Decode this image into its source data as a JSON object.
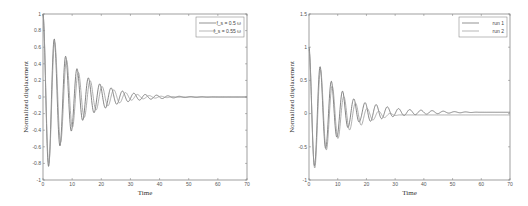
{
  "chart_data": [
    {
      "type": "line",
      "title": "",
      "xlabel": "Time",
      "ylabel": "Normalized displacement",
      "xlim": [
        0,
        70
      ],
      "ylim": [
        -1,
        1
      ],
      "xticks": [
        "0",
        "10",
        "20",
        "30",
        "40",
        "50",
        "60",
        "70"
      ],
      "yticks": [
        "-1",
        "-0.8",
        "-0.6",
        "-0.4",
        "-0.2",
        "0",
        "0.2",
        "0.4",
        "0.6",
        "0.8",
        "1"
      ],
      "grid": false,
      "legend_position": "upper right",
      "series": [
        {
          "name": "f_s = 0.5 ω",
          "x": [
            0,
            2,
            4,
            6,
            8,
            10,
            12,
            14,
            16,
            18,
            20,
            25,
            30,
            35,
            40,
            45,
            50,
            60,
            70
          ],
          "values": [
            1,
            -0.83,
            0.69,
            -0.58,
            0.48,
            -0.4,
            0.33,
            -0.27,
            0.22,
            -0.18,
            0.15,
            0.09,
            0.05,
            0.03,
            0.02,
            0.01,
            0.005,
            0,
            0
          ]
        },
        {
          "name": "f_s = 0.55 ω",
          "x": [
            0,
            2,
            4,
            6,
            8,
            10,
            12,
            14,
            16,
            18,
            20,
            25,
            30,
            35,
            40,
            45,
            50,
            60,
            70
          ],
          "values": [
            1,
            -0.8,
            0.66,
            -0.55,
            0.45,
            -0.37,
            0.3,
            -0.25,
            0.2,
            -0.16,
            0.13,
            0.08,
            0.04,
            0.02,
            0.01,
            0.005,
            0,
            0,
            0
          ]
        }
      ]
    },
    {
      "type": "line",
      "title": "",
      "xlabel": "Time",
      "ylabel": "Normalized displacement",
      "xlim": [
        0,
        70
      ],
      "ylim": [
        -1,
        1.5
      ],
      "xticks": [
        "0",
        "10",
        "20",
        "30",
        "40",
        "50",
        "60",
        "70"
      ],
      "yticks": [
        "-1",
        "-0.5",
        "0",
        "0.5",
        "1",
        "1.5"
      ],
      "grid": false,
      "legend_position": "upper right",
      "series": [
        {
          "name": "run 1",
          "x": [
            0,
            2,
            4,
            6,
            8,
            10,
            12,
            14,
            16,
            18,
            20,
            25,
            30,
            35,
            40,
            45,
            50,
            60,
            70
          ],
          "values": [
            1,
            -0.82,
            0.7,
            -0.55,
            0.48,
            -0.38,
            0.33,
            -0.23,
            0.22,
            -0.15,
            0.17,
            0.12,
            0.08,
            0.06,
            0.05,
            0.04,
            0.03,
            0.02,
            0.02
          ]
        },
        {
          "name": "run 2",
          "x": [
            0,
            2,
            4,
            6,
            8,
            10,
            12,
            14,
            16,
            18,
            20,
            25,
            30,
            35,
            40,
            45,
            50,
            60,
            70
          ],
          "values": [
            1,
            -0.82,
            0.7,
            -0.55,
            0.46,
            -0.38,
            0.3,
            -0.25,
            0.2,
            -0.18,
            0.12,
            0.07,
            0.03,
            0.0,
            -0.01,
            -0.02,
            -0.02,
            -0.02,
            -0.02
          ]
        }
      ]
    }
  ],
  "left": {
    "xlabel": "Time",
    "ylabel": "Normalized displacement",
    "legend": [
      "f_s = 0.5 ω",
      "f_s = 0.55 ω"
    ]
  },
  "right": {
    "xlabel": "Time",
    "ylabel": "Normalized displacement",
    "legend": [
      "run 1",
      "run 2"
    ]
  }
}
